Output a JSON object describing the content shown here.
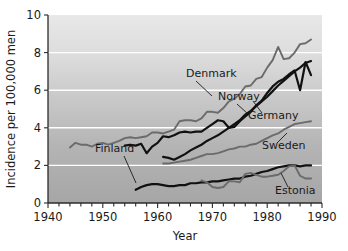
{
  "chart_data": {
    "type": "line",
    "title": "",
    "xlabel": "Year",
    "ylabel": "Incidence per 100,000 men",
    "xlim": [
      1940,
      1990
    ],
    "ylim": [
      0,
      10
    ],
    "xticks": [
      1940,
      1950,
      1960,
      1970,
      1980,
      1990
    ],
    "xtick_labels": [
      "1940",
      "1950",
      "1960",
      "1970",
      "1980",
      "1990"
    ],
    "x_minor_tick_step": 2,
    "yticks": [
      0,
      2,
      4,
      6,
      8,
      10
    ],
    "ytick_labels": [
      "0",
      "2",
      "4",
      "6",
      "8",
      "10"
    ],
    "grid": "horizontal-white-gridlines-at-2-4-6-8",
    "legend_position": "inline-labels-with-leader-lines",
    "background": "vertical-gray-gradient-light-top-dark-bottom",
    "series": [
      {
        "name": "Denmark",
        "color": "#6b6b6b",
        "label_x": 1968,
        "label_y": 7.05,
        "x": [
          1944,
          1945,
          1946,
          1947,
          1948,
          1949,
          1950,
          1951,
          1952,
          1953,
          1954,
          1955,
          1956,
          1957,
          1958,
          1959,
          1960,
          1961,
          1962,
          1963,
          1964,
          1965,
          1966,
          1967,
          1968,
          1969,
          1970,
          1971,
          1972,
          1973,
          1974,
          1975,
          1976,
          1977,
          1978,
          1979,
          1980,
          1981,
          1982,
          1983,
          1984,
          1985,
          1986,
          1987,
          1988
        ],
        "y": [
          2.95,
          3.2,
          3.1,
          3.1,
          3.0,
          3.15,
          3.2,
          3.1,
          3.2,
          3.3,
          3.45,
          3.5,
          3.45,
          3.5,
          3.55,
          3.75,
          3.75,
          3.7,
          3.8,
          3.9,
          4.35,
          4.4,
          4.4,
          4.35,
          4.5,
          4.85,
          4.85,
          4.8,
          5.05,
          5.4,
          5.55,
          5.8,
          6.2,
          6.25,
          6.6,
          6.7,
          7.2,
          7.6,
          8.3,
          7.65,
          7.7,
          8.0,
          8.45,
          8.5,
          8.7
        ]
      },
      {
        "name": "Norway",
        "color": "#111111",
        "label_x": 1974,
        "label_y": 5.85,
        "x": [
          1954,
          1955,
          1956,
          1957,
          1958,
          1959,
          1960,
          1961,
          1962,
          1963,
          1964,
          1965,
          1966,
          1967,
          1968,
          1969,
          1970,
          1971,
          1972,
          1973,
          1974,
          1975,
          1976,
          1977,
          1978,
          1979,
          1980,
          1981,
          1982,
          1983,
          1984,
          1985,
          1986,
          1987,
          1988
        ],
        "y": [
          3.05,
          3.1,
          3.05,
          3.15,
          2.65,
          3.0,
          3.2,
          3.55,
          3.5,
          3.6,
          3.75,
          3.8,
          3.75,
          3.8,
          3.8,
          4.0,
          4.2,
          4.4,
          4.35,
          4.0,
          4.05,
          4.35,
          4.6,
          4.85,
          5.2,
          5.45,
          5.85,
          6.2,
          6.45,
          6.6,
          6.85,
          7.05,
          6.0,
          7.5,
          6.8
        ]
      },
      {
        "name": "Germany",
        "color": "#111111",
        "label_x": 1981,
        "label_y": 5.0,
        "x": [
          1961,
          1962,
          1963,
          1964,
          1965,
          1966,
          1967,
          1968,
          1969,
          1970,
          1971,
          1972,
          1973,
          1974,
          1975,
          1976,
          1977,
          1978,
          1979,
          1980,
          1981,
          1982,
          1983,
          1984,
          1985,
          1986,
          1987,
          1988
        ],
        "y": [
          2.45,
          2.4,
          2.3,
          2.45,
          2.6,
          2.8,
          2.95,
          3.1,
          3.3,
          3.45,
          3.6,
          3.8,
          4.0,
          4.2,
          4.4,
          4.7,
          4.9,
          5.15,
          5.4,
          5.65,
          5.95,
          6.25,
          6.5,
          6.75,
          7.0,
          7.2,
          7.45,
          7.55
        ]
      },
      {
        "name": "Sweden",
        "color": "#6b6b6b",
        "label_x": 1981,
        "label_y": 3.15,
        "x": [
          1961,
          1962,
          1963,
          1964,
          1965,
          1966,
          1967,
          1968,
          1969,
          1970,
          1971,
          1972,
          1973,
          1974,
          1975,
          1976,
          1977,
          1978,
          1979,
          1980,
          1981,
          1982,
          1983,
          1984,
          1985,
          1986,
          1987,
          1988
        ],
        "y": [
          2.1,
          2.1,
          2.15,
          2.2,
          2.25,
          2.3,
          2.4,
          2.5,
          2.6,
          2.6,
          2.65,
          2.75,
          2.85,
          2.9,
          3.0,
          3.0,
          3.1,
          3.15,
          3.3,
          3.45,
          3.6,
          3.7,
          3.9,
          4.05,
          4.2,
          4.25,
          4.3,
          4.35
        ]
      },
      {
        "name": "Finland",
        "color": "#111111",
        "label_x": 1957,
        "label_y": 2.35,
        "x": [
          1956,
          1957,
          1958,
          1959,
          1960,
          1961,
          1962,
          1963,
          1964,
          1965,
          1966,
          1967,
          1968,
          1969,
          1970,
          1971,
          1972,
          1973,
          1974,
          1975,
          1976,
          1977,
          1978,
          1979,
          1980,
          1981,
          1982,
          1983,
          1984,
          1985,
          1986,
          1987,
          1988
        ],
        "y": [
          0.7,
          0.85,
          0.95,
          1.0,
          1.0,
          0.95,
          0.9,
          0.9,
          0.95,
          0.95,
          1.05,
          1.05,
          1.1,
          1.1,
          1.15,
          1.15,
          1.2,
          1.25,
          1.3,
          1.3,
          1.4,
          1.45,
          1.55,
          1.65,
          1.7,
          1.8,
          1.9,
          1.95,
          2.0,
          2.0,
          1.95,
          2.0,
          2.0
        ]
      },
      {
        "name": "Estonia",
        "color": "#6b6b6b",
        "label_x": 1983,
        "label_y": 0.5,
        "x": [
          1968,
          1969,
          1970,
          1971,
          1972,
          1973,
          1974,
          1975,
          1976,
          1977,
          1978,
          1979,
          1980,
          1981,
          1982,
          1983,
          1984,
          1985,
          1986,
          1987,
          1988
        ],
        "y": [
          1.2,
          1.1,
          0.85,
          0.8,
          0.85,
          1.15,
          1.15,
          1.1,
          1.55,
          1.6,
          1.5,
          1.4,
          1.4,
          1.45,
          1.5,
          1.7,
          1.95,
          2.0,
          1.45,
          1.3,
          1.3
        ]
      }
    ]
  },
  "labels": {
    "y_axis_title": "Incidence per 100,000 men",
    "x_axis_title": "Year"
  },
  "colors": {
    "dark_line": "#111111",
    "gray_line": "#6b6b6b",
    "gridline": "#ffffff",
    "axis": "#2b2b2b",
    "plot_bg_top": "#e3e3e3",
    "plot_bg_bottom": "#a9a9a9"
  }
}
